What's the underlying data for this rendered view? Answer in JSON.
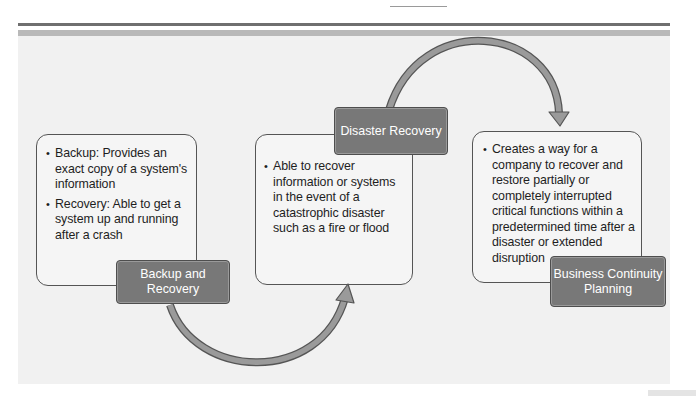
{
  "diagram": {
    "stages": [
      {
        "id": "backup-and-recovery",
        "label": "Backup and Recovery",
        "label_lines": [
          "Backup and",
          "Recovery"
        ],
        "bullets": [
          "Backup: Provides an exact copy of a system's information",
          "Recovery: Able to get a system up and running after a crash"
        ]
      },
      {
        "id": "disaster-recovery",
        "label": "Disaster Recovery",
        "label_lines": [
          "Disaster Recovery"
        ],
        "bullets": [
          "Able to recover information or systems in the event of a catastrophic disaster such as a fire or flood"
        ]
      },
      {
        "id": "business-continuity-planning",
        "label": "Business Continuity Planning",
        "label_lines": [
          "Business Continuity",
          "Planning"
        ],
        "bullets": [
          "Creates a way for a company to recover and restore partially or completely interrupted critical functions within a predetermined time after a disaster or extended disruption"
        ]
      }
    ],
    "connectors": [
      {
        "from": "backup-and-recovery",
        "to": "disaster-recovery",
        "shape": "curved-arrow-below"
      },
      {
        "from": "disaster-recovery",
        "to": "business-continuity-planning",
        "shape": "curved-arrow-above"
      }
    ],
    "colors": {
      "panel_bg": "#f1f1f1",
      "card_bg": "#f5f5f5",
      "card_border": "#555555",
      "label_bg": "#787878",
      "label_text": "#ffffff",
      "arrow_fill": "#9a9a9a",
      "arrow_stroke": "#555555",
      "header_bar_dark": "#6f6f6f",
      "header_bar_light": "#b9b9b9"
    }
  }
}
